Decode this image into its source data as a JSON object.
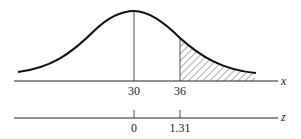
{
  "figure": {
    "type": "normal-distribution-shaded-tail",
    "x_axis": {
      "label": "x",
      "ticks": [
        "30",
        "36"
      ]
    },
    "z_axis": {
      "label": "z",
      "ticks": [
        "0",
        "1.31"
      ]
    },
    "shaded_region": "x > 36 (z > 1.31)",
    "colors": {
      "curve": "#111111",
      "hatch": "#333333"
    }
  }
}
